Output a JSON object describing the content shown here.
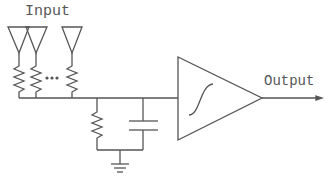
{
  "diagram": {
    "type": "circuit-schematic",
    "labels": {
      "input": "Input",
      "output": "Output"
    },
    "components": {
      "inputs": [
        {
          "id": "input-1",
          "symbol": "antenna-triangle",
          "resistor": true
        },
        {
          "id": "input-2",
          "symbol": "antenna-triangle",
          "resistor": true
        },
        {
          "id": "ellipsis",
          "symbol": "dots"
        },
        {
          "id": "input-n",
          "symbol": "antenna-triangle",
          "resistor": true
        }
      ],
      "shunt_resistor": {
        "to": "ground"
      },
      "shunt_capacitor": {
        "to": "ground"
      },
      "ground": {
        "symbol": "ground"
      },
      "amplifier": {
        "symbol": "triangle",
        "transfer_function": "sigmoid"
      },
      "output_arrow": true
    },
    "colors": {
      "stroke": "#555555",
      "background": "#ffffff"
    }
  }
}
